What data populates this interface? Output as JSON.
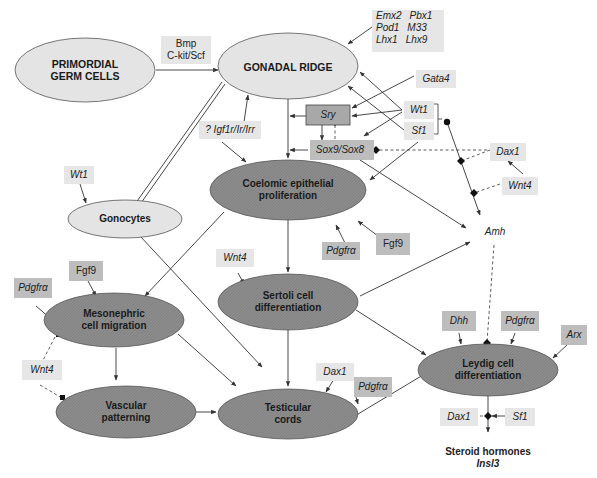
{
  "diagram": {
    "type": "gene-regulatory-pathway",
    "colors": {
      "light_node": "#e4e4e4",
      "dark_node": "#8a8a8a",
      "light_box": "#e6e6e6",
      "mid_box": "#bdbdbd",
      "line": "#333333"
    },
    "nodes": {
      "primordial_germ_cells": {
        "line1": "PRIMORDIAL",
        "line2": "GERM CELLS"
      },
      "gonadal_ridge": {
        "line1": "GONADAL RIDGE"
      },
      "gonocytes": {
        "line1": "Gonocytes"
      },
      "coelomic": {
        "line1": "Coelomic epithelial",
        "line2": "proliferation"
      },
      "sertoli": {
        "line1": "Sertoli cell",
        "line2": "differentiation"
      },
      "mesonephric": {
        "line1": "Mesonephric",
        "line2": "cell migration"
      },
      "vascular": {
        "line1": "Vascular",
        "line2": "patterning"
      },
      "testicular": {
        "line1": "Testicular",
        "line2": "cords"
      },
      "leydig": {
        "line1": "Leydig cell",
        "line2": "differentiation"
      }
    },
    "factors": {
      "bmp": {
        "line1": "Bmp",
        "line2": "C-kit/Scf"
      },
      "gonad_genes": {
        "r1c1": "Emx2",
        "r1c2": "Pbx1",
        "r2c1": "Pod1",
        "r2c2": "M33",
        "r3c1": "Lhx1",
        "r3c2": "Lhx9"
      },
      "gata4": "Gata4",
      "sry": "Sry",
      "sox9": "Sox9/Sox8",
      "wt1_top": "Wt1",
      "sf1_top": "Sf1",
      "igf": "? Igf1r/Ir/Irr",
      "dax1_top": "Dax1",
      "wnt4_top": "Wnt4",
      "amh": "Amh",
      "wt1_gonocytes": "Wt1",
      "fgf9_coelomic": "Fgf9",
      "pdgfra_coelomic": "Pdgfrα",
      "wnt4_sertoli": "Wnt4",
      "fgf9_meso": "Fgf9",
      "pdgfra_meso": "Pdgfrα",
      "wnt4_meso": "Wnt4",
      "dax1_cords": "Dax1",
      "pdgfra_cords": "Pdgfrα",
      "dhh": "Dhh",
      "pdgfra_leydig": "Pdgfrα",
      "arx": "Arx",
      "dax1_bottom": "Dax1",
      "sf1_bottom": "Sf1"
    },
    "outputs": {
      "line1": "Steroid hormones",
      "line2": "Insl3"
    }
  }
}
